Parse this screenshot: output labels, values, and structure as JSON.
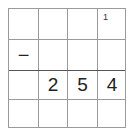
{
  "grid": {
    "rows": 4,
    "cols": 4,
    "cells": [
      [
        "",
        "",
        "",
        ""
      ],
      [
        "−",
        "",
        "",
        ""
      ],
      [
        "",
        "2",
        "5",
        "4"
      ],
      [
        "",
        "",
        "",
        ""
      ]
    ],
    "carry": {
      "row": 0,
      "col": 3,
      "value": "1"
    }
  }
}
